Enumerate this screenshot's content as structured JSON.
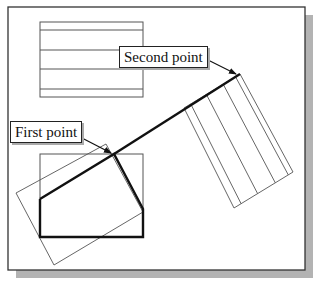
{
  "diagram": {
    "labels": {
      "first_point": "First point",
      "second_point": "Second point"
    },
    "colors": {
      "frame": "#333333",
      "shadow": "#b3b3b3",
      "thin_line": "#555555",
      "thick_line": "#111111",
      "background": "#ffffff"
    },
    "frame": {
      "x": 8,
      "y": 7,
      "width": 297,
      "height": 263,
      "shadow_offset": 8
    },
    "top_rectangle": {
      "x": 40,
      "y": 22,
      "width": 103,
      "height": 75,
      "inner_lines_y": [
        30,
        50,
        69,
        89
      ]
    },
    "bottom_rectangle": {
      "x": 40,
      "y": 154,
      "width": 103,
      "height": 83
    },
    "thick_polyline": [
      [
        40,
        199
      ],
      [
        114,
        154
      ],
      [
        143,
        209
      ],
      [
        143,
        237
      ],
      [
        40,
        237
      ],
      [
        40,
        199
      ]
    ],
    "thick_extension_line": [
      [
        114,
        154
      ],
      [
        240,
        74
      ]
    ],
    "rotated_rectangle_left": [
      [
        106,
        144
      ],
      [
        16,
        193
      ],
      [
        54,
        265
      ],
      [
        143,
        212
      ]
    ],
    "rotated_rectangle_right": {
      "corners": [
        [
          184,
          108
        ],
        [
          240,
          74
        ],
        [
          293,
          172
        ],
        [
          234,
          208
        ]
      ],
      "inner_line_fractions": [
        0.12,
        0.4,
        0.7,
        0.92
      ]
    },
    "first_point_arrow": {
      "from": [
        80,
        137
      ],
      "to": [
        111,
        153
      ]
    },
    "second_point_arrow": {
      "from": [
        202,
        57
      ],
      "to": [
        236,
        74
      ]
    }
  }
}
